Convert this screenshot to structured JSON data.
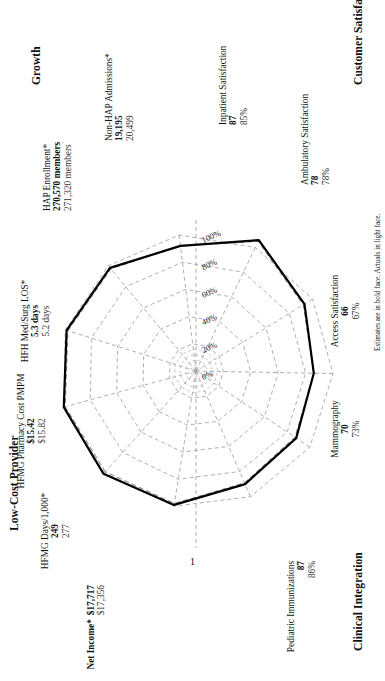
{
  "figure": {
    "footnote": "Estimates are in bold face. Actuals in light face.",
    "axis_marker": "1"
  },
  "groups": [
    {
      "name": "low-cost-provider",
      "label": "Low-Cost Provider"
    },
    {
      "name": "growth",
      "label": "Growth"
    },
    {
      "name": "customer-satisfaction",
      "label": "Customer Satisfaction"
    },
    {
      "name": "clinical-integration",
      "label": "Clinical Integration"
    }
  ],
  "ring_labels": [
    "0%",
    "20%",
    "40%",
    "60%",
    "80%",
    "100%"
  ],
  "chart_data": {
    "type": "radar",
    "title": "",
    "legend": [
      "Estimate (bold face)",
      "Actual (light face)"
    ],
    "grid": true,
    "rings": [
      0,
      20,
      40,
      60,
      80,
      100
    ],
    "rlim": [
      0,
      100
    ],
    "rlabel": "% of target",
    "categories": [
      "Net Income*",
      "HFMG Days/1,000*",
      "HFMG Pharmacy Cost PMPM",
      "HFH Med/Surg LOS*",
      "HAP Enrollment*",
      "Non-HAP Admissions*",
      "Inpatient Satisfaction",
      "Ambulatory Satisfaction",
      "Access Satisfaction",
      "Mammography",
      "Pediatric Immunizations"
    ],
    "axes": [
      {
        "label": "Net Income*",
        "group": "Low-Cost Provider",
        "estimate_text": "$17,717",
        "actual_text": "$17,356",
        "estimate_pct": 101,
        "actual_pct": 99
      },
      {
        "label": "HFMG Days/1,000*",
        "group": "Low-Cost Provider",
        "estimate_text": "249",
        "actual_text": "277",
        "estimate_pct": 100,
        "actual_pct": 99
      },
      {
        "label": "HFMG Pharmacy Cost PMPM",
        "group": "Low-Cost Provider",
        "estimate_text": "$15.42",
        "actual_text": "$15.82",
        "estimate_pct": 99,
        "actual_pct": 98
      },
      {
        "label": "HFH Med/Surg LOS*",
        "group": "Low-Cost Provider",
        "estimate_text": "5.3 days",
        "actual_text": "5.2 days",
        "estimate_pct": 98,
        "actual_pct": 97
      },
      {
        "label": "HAP Enrollment*",
        "group": "Growth",
        "estimate_text": "270,570 members",
        "actual_text": "271,320 members",
        "estimate_pct": 92,
        "actual_pct": 92
      },
      {
        "label": "Non-HAP Admissions*",
        "group": "Growth",
        "estimate_text": "19,195",
        "actual_text": "20,499",
        "estimate_pct": 106,
        "actual_pct": 105
      },
      {
        "label": "Inpatient Satisfaction",
        "group": "Customer Satisfaction",
        "estimate_text": "87",
        "actual_text": "85%",
        "estimate_pct": 93,
        "actual_pct": 92
      },
      {
        "label": "Ambulatory Satisfaction",
        "group": "Customer Satisfaction",
        "estimate_text": "78",
        "actual_text": "78%",
        "estimate_pct": 86,
        "actual_pct": 86
      },
      {
        "label": "Access Satisfaction",
        "group": "Customer Satisfaction",
        "estimate_text": "66",
        "actual_text": "67%",
        "estimate_pct": 88,
        "actual_pct": 87
      },
      {
        "label": "Mammography",
        "group": "Clinical Integration",
        "estimate_text": "70",
        "actual_text": "73%",
        "estimate_pct": 90,
        "actual_pct": 89
      },
      {
        "label": "Pediatric Immunizations",
        "group": "Clinical Integration",
        "estimate_text": "87",
        "actual_text": "86%",
        "estimate_pct": 99,
        "actual_pct": 98
      }
    ]
  }
}
